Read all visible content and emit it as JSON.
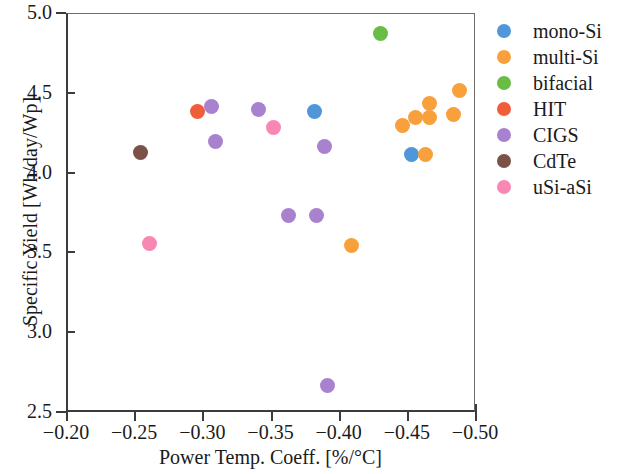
{
  "chart_data": {
    "type": "scatter",
    "title": "",
    "xlabel": "Power Temp. Coeff. [%/°C]",
    "ylabel": "Specific Yield [Wh/day/Wp]",
    "xlim": [
      -0.2,
      -0.5
    ],
    "ylim": [
      2.5,
      5.0
    ],
    "x_inverted": true,
    "grid": false,
    "legend_position": "right",
    "xticks": [
      "−0.20",
      "−0.25",
      "−0.30",
      "−0.35",
      "−0.40",
      "−0.45",
      "−0.50"
    ],
    "xtick_values": [
      -0.2,
      -0.25,
      -0.3,
      -0.35,
      -0.4,
      -0.45,
      -0.5
    ],
    "yticks": [
      "2.5",
      "3.0",
      "3.5",
      "4.0",
      "4.5",
      "5.0"
    ],
    "ytick_values": [
      2.5,
      3.0,
      3.5,
      4.0,
      4.5,
      5.0
    ],
    "series": [
      {
        "name": "mono-Si",
        "color": "#4f97d8",
        "points": [
          {
            "x": -0.381,
            "y": 4.39
          },
          {
            "x": -0.452,
            "y": 4.12
          }
        ]
      },
      {
        "name": "multi-Si",
        "color": "#f8a03c",
        "points": [
          {
            "x": -0.445,
            "y": 4.3
          },
          {
            "x": -0.455,
            "y": 4.35
          },
          {
            "x": -0.465,
            "y": 4.44
          },
          {
            "x": -0.465,
            "y": 4.35
          },
          {
            "x": -0.483,
            "y": 4.37
          },
          {
            "x": -0.487,
            "y": 4.52
          },
          {
            "x": -0.462,
            "y": 4.12
          },
          {
            "x": -0.408,
            "y": 3.55
          }
        ]
      },
      {
        "name": "bifacial",
        "color": "#69bd45",
        "points": [
          {
            "x": -0.429,
            "y": 4.88
          }
        ]
      },
      {
        "name": "HIT",
        "color": "#ef5d3a",
        "points": [
          {
            "x": -0.295,
            "y": 4.39
          }
        ]
      },
      {
        "name": "CIGS",
        "color": "#a982cf",
        "points": [
          {
            "x": -0.305,
            "y": 4.42
          },
          {
            "x": -0.308,
            "y": 4.2
          },
          {
            "x": -0.34,
            "y": 4.4
          },
          {
            "x": -0.362,
            "y": 3.74
          },
          {
            "x": -0.382,
            "y": 3.74
          },
          {
            "x": -0.388,
            "y": 4.17
          },
          {
            "x": -0.39,
            "y": 2.67
          }
        ]
      },
      {
        "name": "CdTe",
        "color": "#7b5245",
        "points": [
          {
            "x": -0.253,
            "y": 4.13
          }
        ]
      },
      {
        "name": "uSi-aSi",
        "color": "#f887b4",
        "points": [
          {
            "x": -0.26,
            "y": 3.56
          },
          {
            "x": -0.351,
            "y": 4.29
          }
        ]
      }
    ]
  },
  "legend": {
    "entries": [
      {
        "label": "mono-Si",
        "color": "#4f97d8"
      },
      {
        "label": "multi-Si",
        "color": "#f8a03c"
      },
      {
        "label": "bifacial",
        "color": "#69bd45"
      },
      {
        "label": "HIT",
        "color": "#ef5d3a"
      },
      {
        "label": "CIGS",
        "color": "#a982cf"
      },
      {
        "label": "CdTe",
        "color": "#7b5245"
      },
      {
        "label": "uSi-aSi",
        "color": "#f887b4"
      }
    ]
  }
}
